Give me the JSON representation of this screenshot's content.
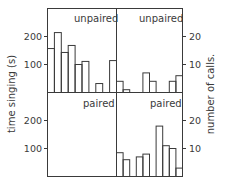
{
  "chart_data": {
    "type": "bar",
    "layout": "2x2 histogram panels sharing frame",
    "left_axis": {
      "label": "time singing (s)",
      "ticks": [
        100,
        200
      ],
      "units_per_px": 3.571
    },
    "right_axis": {
      "label": "number of calls.",
      "ticks": [
        10,
        20
      ]
    },
    "panels": [
      {
        "id": "top-left",
        "title": "unpaired",
        "measure": "time singing (s)",
        "values": [
          157,
          214,
          143,
          168,
          100,
          111,
          0,
          32,
          0,
          114
        ]
      },
      {
        "id": "top-right",
        "title": "unpaired",
        "measure": "number of calls",
        "values": [
          4,
          1,
          0,
          0,
          7,
          4,
          0,
          0,
          4,
          6
        ]
      },
      {
        "id": "bottom-left",
        "title": "paired",
        "measure": "time singing (s)",
        "values": [
          0,
          0,
          0,
          0,
          0,
          0,
          0,
          0,
          0,
          0
        ]
      },
      {
        "id": "bottom-right",
        "title": "paired",
        "measure": "number of calls",
        "values": [
          8.5,
          6,
          0,
          7,
          8,
          0,
          18,
          11,
          10,
          3
        ]
      }
    ],
    "xlabel": "",
    "grid": false
  },
  "labels": {
    "top_left_title": "unpaired",
    "top_right_title": "unpaired",
    "bottom_left_title": "paired",
    "bottom_right_title": "paired",
    "left_axis_label": "time singing (s)",
    "right_axis_label": "number of calls.",
    "left_ticks_top": [
      "200",
      "100"
    ],
    "left_ticks_bottom": [
      "200",
      "100"
    ],
    "right_ticks_top": [
      "20",
      "10"
    ],
    "right_ticks_bottom": [
      "20",
      "10"
    ]
  }
}
